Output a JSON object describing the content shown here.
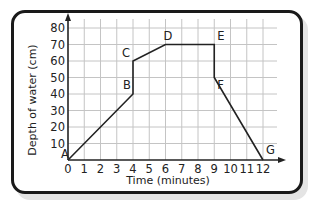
{
  "chart_data": {
    "type": "line",
    "title": "",
    "xlabel": "Time (minutes)",
    "ylabel": "Depth of water (cm)",
    "xlim": [
      0,
      12
    ],
    "ylim": [
      0,
      80
    ],
    "x_ticks": [
      0,
      1,
      2,
      3,
      4,
      5,
      6,
      7,
      8,
      9,
      10,
      11,
      12
    ],
    "y_ticks": [
      10,
      20,
      30,
      40,
      50,
      60,
      70,
      80
    ],
    "x_origin_label": "0",
    "grid": true,
    "legend": null,
    "series": [
      {
        "name": "Depth of water",
        "points": [
          {
            "label": "A",
            "x": 0,
            "y": 0
          },
          {
            "label": "B",
            "x": 4,
            "y": 40
          },
          {
            "label": "C",
            "x": 4,
            "y": 60
          },
          {
            "label": "D",
            "x": 6,
            "y": 70
          },
          {
            "label": "E",
            "x": 9,
            "y": 70
          },
          {
            "label": "F",
            "x": 9,
            "y": 50
          },
          {
            "label": "G",
            "x": 12,
            "y": 0
          }
        ]
      }
    ]
  },
  "colors": {
    "line": "#222222",
    "grid": "#c4c4c4",
    "axis": "#222222",
    "frame": "#1a1a1a",
    "shadow": "#e4e4e4"
  }
}
